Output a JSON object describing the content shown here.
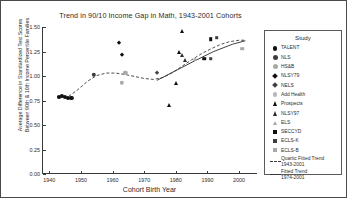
{
  "chart_data": {
    "type": "scatter",
    "title": "Trend in 90/10 Income Gap in Math, 1943-2001 Cohorts",
    "xlabel": "Cohort Birth Year",
    "ylabel_line1": "Average Difference in Standardized Test Scores",
    "ylabel_line2": "Between 90th & 10th Income Percentile Families",
    "xlim": [
      1938,
      2006
    ],
    "ylim": [
      0.0,
      1.5
    ],
    "xticks": [
      "1940",
      "1950",
      "1960",
      "1970",
      "1980",
      "1990",
      "2000"
    ],
    "xtick_values": [
      1940,
      1950,
      1960,
      1970,
      1980,
      1990,
      2000
    ],
    "yticks": [
      "0.00",
      "0.25",
      "0.50",
      "0.75",
      "1.00",
      "1.25",
      "1.50"
    ],
    "ytick_values": [
      0.0,
      0.25,
      0.5,
      0.75,
      1.0,
      1.25,
      1.5
    ],
    "grid": false,
    "legend_position": "right-outside",
    "legend_title": "Study",
    "series": [
      {
        "name": "TALENT",
        "marker": "circle",
        "color": "#101010",
        "size": 4.2,
        "points": [
          {
            "x": 1943,
            "y": 0.79
          },
          {
            "x": 1944,
            "y": 0.795
          },
          {
            "x": 1945,
            "y": 0.785
          },
          {
            "x": 1946,
            "y": 0.775
          },
          {
            "x": 1947,
            "y": 0.775
          }
        ]
      },
      {
        "name": "NLS",
        "marker": "circle",
        "color": "#3e3e3e",
        "size": 4.4,
        "points": [
          {
            "x": 1954,
            "y": 1.01
          }
        ]
      },
      {
        "name": "HS&B",
        "marker": "circle",
        "color": "#a8a8a8",
        "size": 4.4,
        "points": [
          {
            "x": 1964,
            "y": 1.03
          },
          {
            "x": 1963,
            "y": 0.93
          }
        ]
      },
      {
        "name": "NLSY79",
        "marker": "diamond",
        "color": "#101010",
        "size": 4.6,
        "points": [
          {
            "x": 1962,
            "y": 1.335
          },
          {
            "x": 1963,
            "y": 1.21
          }
        ]
      },
      {
        "name": "NELS",
        "marker": "diamond",
        "color": "#3e3e3e",
        "size": 4.6,
        "points": [
          {
            "x": 1974,
            "y": 1.03
          }
        ]
      },
      {
        "name": "Add Health",
        "marker": "circle",
        "color": "#b8b8b8",
        "size": 4.2,
        "points": []
      },
      {
        "name": "Prospects",
        "marker": "triangle",
        "color": "#101010",
        "size": 5.0,
        "points": [
          {
            "x": 1978,
            "y": 0.7
          },
          {
            "x": 1982,
            "y": 1.455
          },
          {
            "x": 1981,
            "y": 1.24
          },
          {
            "x": 1980,
            "y": 0.93
          }
        ]
      },
      {
        "name": "NLSY97",
        "marker": "triangle",
        "color": "#2e2e2e",
        "size": 5.0,
        "points": [
          {
            "x": 1982,
            "y": 1.21
          },
          {
            "x": 1983,
            "y": 1.16
          }
        ]
      },
      {
        "name": "ELS",
        "marker": "triangle",
        "color": "#a8a8a8",
        "size": 4.6,
        "points": [
          {
            "x": 1986,
            "y": 1.17
          }
        ]
      },
      {
        "name": "SECCYD",
        "marker": "square",
        "color": "#101010",
        "size": 4.4,
        "points": [
          {
            "x": 1991,
            "y": 1.375
          },
          {
            "x": 1989,
            "y": 1.175
          }
        ]
      },
      {
        "name": "ECLS-K",
        "marker": "square",
        "color": "#3e3e3e",
        "size": 4.4,
        "points": [
          {
            "x": 1993,
            "y": 1.39
          },
          {
            "x": 1991,
            "y": 1.175
          }
        ]
      },
      {
        "name": "ECLS-B",
        "marker": "square",
        "color": "#a8a8a8",
        "size": 4.4,
        "points": [
          {
            "x": 2001,
            "y": 1.28
          }
        ]
      }
    ],
    "trend_lines": [
      {
        "name": "Quartic Fitted Trend 1943-2001",
        "label_line1": "Quartic Fitted Trend",
        "label_line2": "1943-2001",
        "style": "dashed",
        "color": "#3a3a3a",
        "points": [
          {
            "x": 1943,
            "y": 0.775
          },
          {
            "x": 1946,
            "y": 0.79
          },
          {
            "x": 1949,
            "y": 0.86
          },
          {
            "x": 1952,
            "y": 0.945
          },
          {
            "x": 1955,
            "y": 1.005
          },
          {
            "x": 1958,
            "y": 1.03
          },
          {
            "x": 1961,
            "y": 1.03
          },
          {
            "x": 1964,
            "y": 1.015
          },
          {
            "x": 1967,
            "y": 0.995
          },
          {
            "x": 1970,
            "y": 0.975
          },
          {
            "x": 1973,
            "y": 0.965
          },
          {
            "x": 1976,
            "y": 0.985
          },
          {
            "x": 1979,
            "y": 1.035
          },
          {
            "x": 1982,
            "y": 1.1
          },
          {
            "x": 1985,
            "y": 1.165
          },
          {
            "x": 1988,
            "y": 1.225
          },
          {
            "x": 1991,
            "y": 1.275
          },
          {
            "x": 1994,
            "y": 1.32
          },
          {
            "x": 1997,
            "y": 1.35
          },
          {
            "x": 2000,
            "y": 1.365
          },
          {
            "x": 2002,
            "y": 1.365
          }
        ]
      },
      {
        "name": "Fitted Trend 1974-2001",
        "label_line1": "Fitted Trend",
        "label_line2": "1974-2001",
        "style": "solid",
        "color": "#2a2a2a",
        "points": [
          {
            "x": 1974,
            "y": 0.955
          },
          {
            "x": 1980,
            "y": 1.055
          },
          {
            "x": 1986,
            "y": 1.155
          },
          {
            "x": 1992,
            "y": 1.25
          },
          {
            "x": 1998,
            "y": 1.325
          },
          {
            "x": 2002,
            "y": 1.36
          }
        ]
      }
    ]
  }
}
